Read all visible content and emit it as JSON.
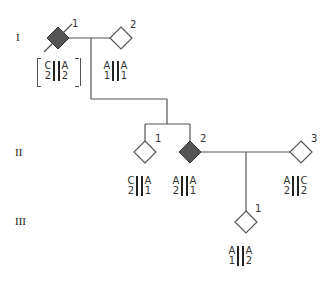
{
  "generations": [
    {
      "label": "I"
    },
    {
      "label": "II"
    },
    {
      "label": "III"
    }
  ],
  "individuals": [
    {
      "id": "I-1",
      "number": "1",
      "affected": true,
      "deceased": true,
      "haplotype_left": [
        "C",
        "2"
      ],
      "haplotype_right": [
        "A",
        "2"
      ],
      "bracketed": true
    },
    {
      "id": "I-2",
      "number": "2",
      "affected": false,
      "deceased": false,
      "haplotype_left": [
        "A",
        "1"
      ],
      "haplotype_right": [
        "A",
        "1"
      ]
    },
    {
      "id": "II-1",
      "number": "1",
      "affected": false,
      "deceased": false,
      "haplotype_left": [
        "C",
        "2"
      ],
      "haplotype_right": [
        "A",
        "1"
      ]
    },
    {
      "id": "II-2",
      "number": "2",
      "affected": true,
      "deceased": false,
      "haplotype_left": [
        "A",
        "2"
      ],
      "haplotype_right": [
        "A",
        "1"
      ]
    },
    {
      "id": "II-3",
      "number": "3",
      "affected": false,
      "deceased": false,
      "haplotype_left": [
        "A",
        "2"
      ],
      "haplotype_right": [
        "C",
        "2"
      ]
    },
    {
      "id": "III-1",
      "number": "1",
      "affected": false,
      "deceased": false,
      "haplotype_left": [
        "A",
        "1"
      ],
      "haplotype_right": [
        "A",
        "2"
      ]
    }
  ],
  "colors": {
    "affected_fill": "#555555",
    "line": "#555555",
    "unaffected_fill": "#ffffff"
  }
}
